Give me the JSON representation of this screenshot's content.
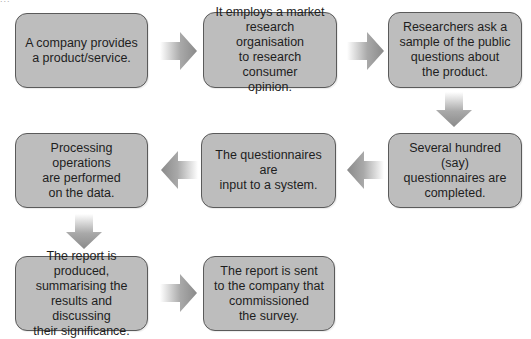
{
  "diagram": {
    "type": "flowchart",
    "corner_text": "...",
    "colors": {
      "box_fill": "#bdbdbd",
      "box_border": "#5a5a5a",
      "arrow": "#8a8a8a",
      "text": "#1e1e1e"
    },
    "steps": [
      {
        "id": 1,
        "text": "A company provides\na product/service."
      },
      {
        "id": 2,
        "text": "It employs a market\nresearch organisation\nto research consumer\nopinion."
      },
      {
        "id": 3,
        "text": "Researchers ask a\nsample of the public\nquestions about\nthe product."
      },
      {
        "id": 4,
        "text": "Several hundred (say)\nquestionnaires are\ncompleted."
      },
      {
        "id": 5,
        "text": "The questionnaires are\ninput to a system."
      },
      {
        "id": 6,
        "text": "Processing operations\nare performed\non the data."
      },
      {
        "id": 7,
        "text": "The report is produced,\nsummarising the\nresults and discussing\ntheir significance."
      },
      {
        "id": 8,
        "text": "The report is sent\nto the company that\ncommissioned\nthe survey."
      }
    ],
    "arrows": [
      {
        "from": 1,
        "to": 2,
        "direction": "right"
      },
      {
        "from": 2,
        "to": 3,
        "direction": "right"
      },
      {
        "from": 3,
        "to": 4,
        "direction": "down"
      },
      {
        "from": 4,
        "to": 5,
        "direction": "left"
      },
      {
        "from": 5,
        "to": 6,
        "direction": "left"
      },
      {
        "from": 6,
        "to": 7,
        "direction": "down"
      },
      {
        "from": 7,
        "to": 8,
        "direction": "right"
      }
    ]
  }
}
